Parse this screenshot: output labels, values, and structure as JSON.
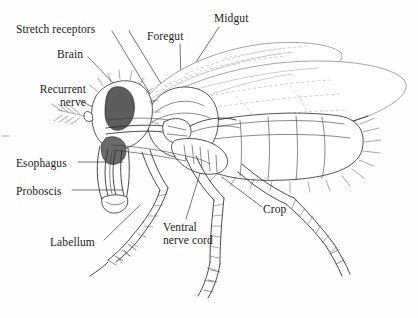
{
  "figure": {
    "type": "biological-line-diagram",
    "background_color": "#fefefe",
    "ink_color": "#1a1a1a",
    "brain_fill": "#5d5d5d",
    "wing_vein_color": "#b9b9b9"
  },
  "labels": [
    {
      "id": "stretch-receptors",
      "text": "Stretch receptors",
      "x": 16,
      "y": 23
    },
    {
      "id": "brain",
      "text": "Brain",
      "x": 57,
      "y": 48
    },
    {
      "id": "recurrent-nerve",
      "text": "Recurrent\nnerve",
      "x": 14,
      "y": 83
    },
    {
      "id": "foregut",
      "text": "Foregut",
      "x": 147,
      "y": 30
    },
    {
      "id": "midgut",
      "text": "Midgut",
      "x": 214,
      "y": 12
    },
    {
      "id": "esophagus",
      "text": "Esophagus",
      "x": 16,
      "y": 157
    },
    {
      "id": "proboscis",
      "text": "Proboscis",
      "x": 16,
      "y": 185
    },
    {
      "id": "labellum",
      "text": "Labellum",
      "x": 50,
      "y": 236
    },
    {
      "id": "ventral-nerve-cord",
      "text": "Ventral\nnerve cord",
      "x": 163,
      "y": 221
    },
    {
      "id": "crop",
      "text": "Crop",
      "x": 263,
      "y": 203
    }
  ]
}
